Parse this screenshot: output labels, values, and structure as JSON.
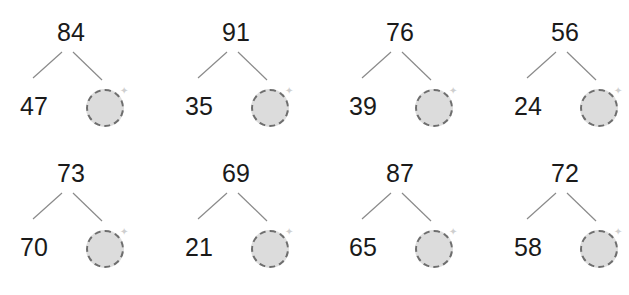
{
  "worksheet": {
    "type": "number-bond-missing-part",
    "colors": {
      "text": "#1a1a1a",
      "line": "#8a8a8a",
      "circle_fill": "#dcdcdc",
      "circle_border": "#6e6e6e"
    },
    "trees": [
      {
        "whole": "84",
        "part": "47",
        "missing": ""
      },
      {
        "whole": "91",
        "part": "35",
        "missing": ""
      },
      {
        "whole": "76",
        "part": "39",
        "missing": ""
      },
      {
        "whole": "56",
        "part": "24",
        "missing": ""
      },
      {
        "whole": "73",
        "part": "70",
        "missing": ""
      },
      {
        "whole": "69",
        "part": "21",
        "missing": ""
      },
      {
        "whole": "87",
        "part": "65",
        "missing": ""
      },
      {
        "whole": "72",
        "part": "58",
        "missing": ""
      }
    ]
  }
}
